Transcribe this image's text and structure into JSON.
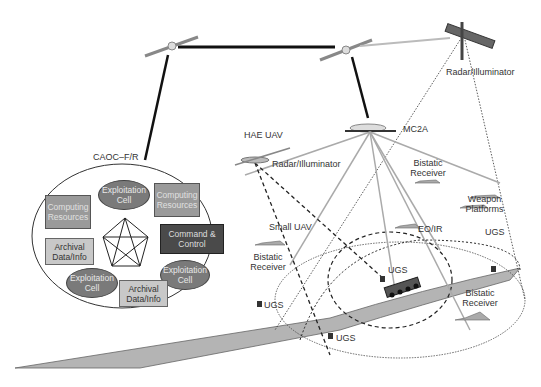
{
  "diagram": {
    "caoc": {
      "title": "CAOC–F/R",
      "nodes": {
        "exploitation_top": "Exploitation Cell",
        "computing_left": "Computing Resources",
        "computing_right": "Computing Resources",
        "command_control": "Command & Control",
        "archival_left": "Archival Data/Info",
        "exploitation_left": "Exploitation Cell",
        "exploitation_right": "Exploitation Cell",
        "archival_bottom": "Archival Data/Info"
      }
    },
    "labels": {
      "radar_satellite": "Radar/Illuminator",
      "mc2a": "MC2A",
      "hae_uav": "HAE UAV",
      "hae_radar": "Radar/Illuminator",
      "bistatic_top_1": "Bistatic",
      "bistatic_top_2": "Receiver",
      "weapon_1": "Weapon",
      "weapon_2": "Platforms",
      "small_uav": "Small UAV",
      "bistatic_left_1": "Bistatic",
      "bistatic_left_2": "Receiver",
      "eo_ir": "EO/IR",
      "ugs_right": "UGS",
      "ugs_center": "UGS",
      "ugs_left": "UGS",
      "ugs_bottom": "UGS",
      "bistatic_right_1": "Bistatic",
      "bistatic_right_2": "Receiver"
    }
  }
}
